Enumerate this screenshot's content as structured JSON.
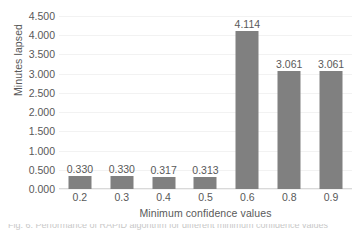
{
  "chart_data": {
    "type": "bar",
    "title": "",
    "xlabel": "Minimum confidence values",
    "ylabel": "Minutes lapsed",
    "categories": [
      "0.2",
      "0.3",
      "0.4",
      "0.5",
      "0.6",
      "0.8",
      "0.9"
    ],
    "values": [
      0.33,
      0.33,
      0.317,
      0.313,
      4.114,
      3.061,
      3.061
    ],
    "data_labels": [
      "0.330",
      "0.330",
      "0.317",
      "0.313",
      "4.114",
      "3.061",
      "3.061"
    ],
    "ylim": [
      0,
      4.5
    ],
    "ytick_labels": [
      "4.500",
      "4.000",
      "3.500",
      "3.000",
      "2.500",
      "2.000",
      "1.500",
      "1.000",
      "0.500",
      "0.000"
    ],
    "ytick_values": [
      4.5,
      4.0,
      3.5,
      3.0,
      2.5,
      2.0,
      1.5,
      1.0,
      0.5,
      0.0
    ],
    "grid": true,
    "grid_axis": "y",
    "legend": false,
    "legend_position": "none",
    "series": [
      {
        "name": "Minutes lapsed",
        "color": "#808080",
        "values": [
          0.33,
          0.33,
          0.317,
          0.313,
          4.114,
          3.061,
          3.061
        ]
      }
    ],
    "colors": {
      "bar": "#808080",
      "gridline": "#f2f2f2",
      "axis_line": "#d9d9d9",
      "text": "#595959",
      "background": "#ffffff"
    }
  },
  "caption_sliver": {
    "text": "Fig. 6. Performance of RAPID algorithm for different minimum confidence values"
  }
}
